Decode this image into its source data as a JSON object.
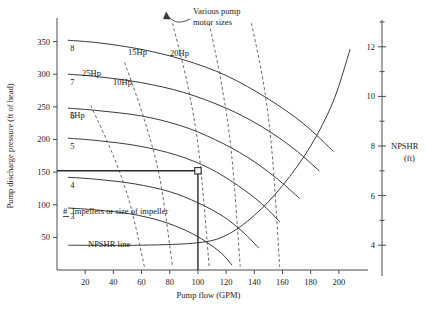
{
  "chart_data": {
    "type": "line",
    "title": "",
    "xlabel": "Pump flow (GPM)",
    "ylabel": "Pump discharge pressure (ft of head)",
    "y2label": "NPSHR",
    "y2label_units": "(ft)",
    "xlim": [
      0,
      215
    ],
    "ylim": [
      0,
      380
    ],
    "y2lim": [
      3,
      13
    ],
    "grid": false,
    "legend": "none",
    "xticks": [
      20,
      40,
      60,
      80,
      100,
      120,
      140,
      160,
      180,
      200
    ],
    "yticks": [
      50,
      100,
      150,
      200,
      250,
      300,
      350
    ],
    "y2ticks": [
      4,
      6,
      8,
      10,
      12
    ],
    "y2minorticks": [
      5,
      7,
      9,
      11,
      13
    ],
    "series": [
      {
        "name": "8",
        "label": "8",
        "kind": "pump-curve",
        "x": [
          8,
          30,
          60,
          90,
          120,
          150,
          175,
          196
        ],
        "y": [
          352,
          348,
          338,
          322,
          298,
          262,
          224,
          182
        ]
      },
      {
        "name": "7",
        "label": "7",
        "kind": "pump-curve",
        "x": [
          8,
          30,
          60,
          90,
          120,
          145,
          168,
          186
        ],
        "y": [
          300,
          296,
          287,
          272,
          248,
          220,
          186,
          152
        ]
      },
      {
        "name": "6",
        "label": "6",
        "kind": "pump-curve",
        "x": [
          8,
          30,
          60,
          88,
          112,
          135,
          155,
          172
        ],
        "y": [
          248,
          244,
          236,
          221,
          200,
          173,
          142,
          110
        ]
      },
      {
        "name": "5",
        "label": "5",
        "kind": "pump-curve",
        "x": [
          8,
          30,
          58,
          85,
          108,
          128,
          145,
          158
        ],
        "y": [
          202,
          198,
          190,
          176,
          156,
          130,
          102,
          74
        ]
      },
      {
        "name": "4",
        "label": "4",
        "kind": "pump-curve",
        "x": [
          8,
          28,
          55,
          80,
          100,
          118,
          132,
          143
        ],
        "y": [
          142,
          139,
          132,
          120,
          103,
          82,
          58,
          34
        ]
      },
      {
        "name": "3",
        "label": "3",
        "kind": "pump-curve",
        "x": [
          8,
          28,
          52,
          74,
          92,
          106,
          117,
          124
        ],
        "y": [
          95,
          92,
          86,
          75,
          60,
          43,
          25,
          8
        ]
      }
    ],
    "hp_series": [
      {
        "name": "5Hp",
        "label": "5Hp",
        "kind": "hp-line",
        "x": [
          24,
          40,
          52,
          62
        ],
        "y": [
          252,
          175,
          100,
          5
        ]
      },
      {
        "name": "10Hp",
        "label": "10Hp",
        "kind": "hp-line",
        "x": [
          48,
          62,
          73,
          82
        ],
        "y": [
          318,
          230,
          140,
          5
        ]
      },
      {
        "name": "25Hp",
        "label": "25Hp",
        "kind": "hp-line",
        "x": [
          82,
          93,
          101,
          108
        ],
        "y": [
          378,
          280,
          175,
          5
        ]
      },
      {
        "name": "15Hp",
        "label": "15Hp",
        "kind": "hp-line",
        "x": [
          108,
          117,
          124,
          130
        ],
        "y": [
          378,
          282,
          175,
          5
        ]
      },
      {
        "name": "20Hp",
        "label": "20Hp",
        "kind": "hp-line",
        "x": [
          138,
          147,
          153,
          158
        ],
        "y": [
          378,
          280,
          170,
          5
        ]
      }
    ],
    "npshr_series": {
      "name": "NPSHR line",
      "label": "NPSHR line",
      "kind": "npshr-curve",
      "x": [
        8,
        60,
        100,
        120,
        140,
        160,
        180,
        196,
        208
      ],
      "y2": [
        4.0,
        4.0,
        4.1,
        4.4,
        5.2,
        6.4,
        8.0,
        9.8,
        11.9
      ]
    },
    "operating_point": {
      "label": "operating point",
      "flow": 100,
      "head": 152
    },
    "annotations": [
      {
        "name": "motor-size-note",
        "text_line1": "Various pump",
        "text_line2": "motor sizes"
      },
      {
        "name": "impeller-note",
        "symbol": "#",
        "text": "Impellers or size of impeller"
      },
      {
        "name": "npshr-line-note",
        "text": "NPSHR line"
      }
    ]
  },
  "colors": {
    "pump_curve": "#3a3a3a",
    "hp_curve": "#6b6b6b",
    "axis": "#4a4a4a",
    "operating_line": "#2a2a2a",
    "background": "#ffffff"
  }
}
